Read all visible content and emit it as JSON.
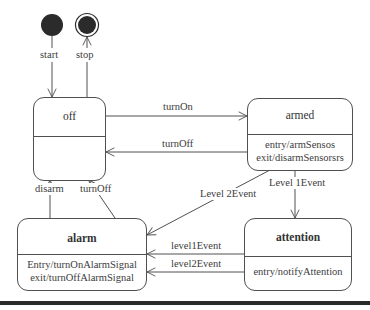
{
  "diagram": {
    "type": "state-machine",
    "pseudostates": {
      "start": {
        "label": "start"
      },
      "stop": {
        "label": "stop"
      }
    },
    "states": {
      "off": {
        "name": "off",
        "actions": []
      },
      "armed": {
        "name": "armed",
        "actions": [
          "entry/armSensos",
          "exit/disarmSensorsrs"
        ]
      },
      "alarm": {
        "name": "alarm",
        "actions": [
          "Entry/turnOnAlarmSignal",
          "exit/turnOffAlarmSignal"
        ]
      },
      "attention": {
        "name": "attention",
        "actions": [
          "entry/notifyAttention"
        ]
      }
    },
    "transitions": [
      {
        "from": "start",
        "to": "off",
        "label": ""
      },
      {
        "from": "off",
        "to": "stop",
        "label": ""
      },
      {
        "from": "off",
        "to": "armed",
        "label": "turnOn"
      },
      {
        "from": "armed",
        "to": "off",
        "label": "turnOff"
      },
      {
        "from": "armed",
        "to": "alarm",
        "label": "Level 2Event"
      },
      {
        "from": "armed",
        "to": "attention",
        "label": "Level 1Event"
      },
      {
        "from": "alarm",
        "to": "off",
        "label": "disarm"
      },
      {
        "from": "alarm",
        "to": "off",
        "label": "turnOff"
      },
      {
        "from": "attention",
        "to": "alarm",
        "label": "level1Event"
      },
      {
        "from": "attention",
        "to": "alarm",
        "label": "level2Event"
      }
    ]
  },
  "labels": {
    "start": "start",
    "stop": "stop",
    "turnOn": "turnOn",
    "turnOff_armed_off": "turnOff",
    "level2Event_armed_alarm": "Level 2Event",
    "level1Event_armed_attention": "Level 1Event",
    "disarm": "disarm",
    "turnOff_alarm_off": "turnOff",
    "level1Event_attention_alarm": "level1Event",
    "level2Event_attention_alarm": "level2Event"
  },
  "colors": {
    "line": "#505050",
    "fill_dark": "#2b2b2b",
    "background": "#ffffff"
  }
}
